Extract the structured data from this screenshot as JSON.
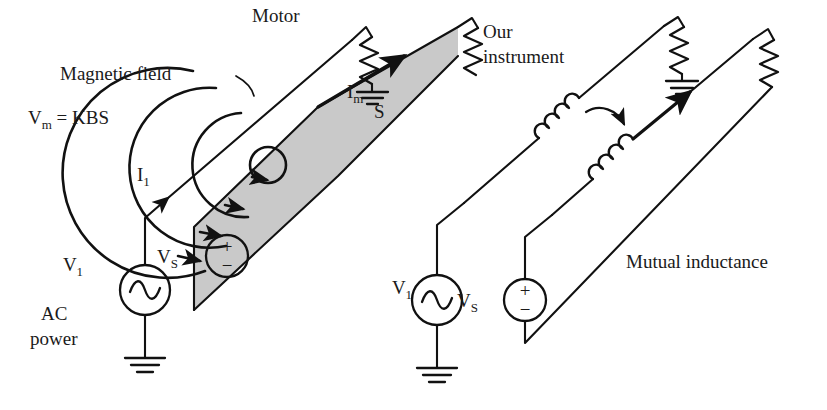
{
  "figure": {
    "background_color": "#ffffff",
    "line_color": "#111111",
    "plane_fill_color": "#c9c9c9",
    "width": 827,
    "height": 410
  },
  "left_panel": {
    "name": "physical-pictorial-view",
    "labels": {
      "magnetic_field": "Magnetic field",
      "motor": "Motor",
      "vm_equation": "V",
      "vm_equation_sub": "m",
      "vm_equation_rest": " = KBS",
      "vm_equation_full": "Vm = KBS",
      "current_primary": "I",
      "current_primary_sub": "1",
      "current_motor": "I",
      "current_motor_sub": "m",
      "loop_area": "S",
      "source_secondary": "V",
      "source_secondary_sub": "S",
      "source_primary": "V",
      "source_primary_sub": "1",
      "ac_line_1": "AC",
      "ac_line_2": "power"
    },
    "components": {
      "ac_source_symbol": "sine-wave",
      "ground_symbol": "earth-ground",
      "resistor_symbol": "zigzag",
      "polarity_plus": "+",
      "polarity_minus": "−"
    },
    "field_rings": 4
  },
  "right_panel": {
    "name": "equivalent-circuit-view",
    "labels": {
      "our_instrument_line_1": "Our",
      "our_instrument_line_2": "instrument",
      "our_instrument": "Our instrument",
      "mutual_inductance": "Mutual inductance",
      "source_primary": "V",
      "source_primary_sub": "1",
      "source_secondary": "V",
      "source_secondary_sub": "S"
    },
    "components": {
      "inductor_symbol": "coil",
      "coupling_arrow": "curved-arrow",
      "ac_source_symbol": "sine-wave",
      "ground_symbol": "earth-ground",
      "resistor_symbol": "zigzag",
      "polarity_plus": "+",
      "polarity_minus": "−"
    },
    "inductor_count": 2,
    "resistor_count": 2
  }
}
